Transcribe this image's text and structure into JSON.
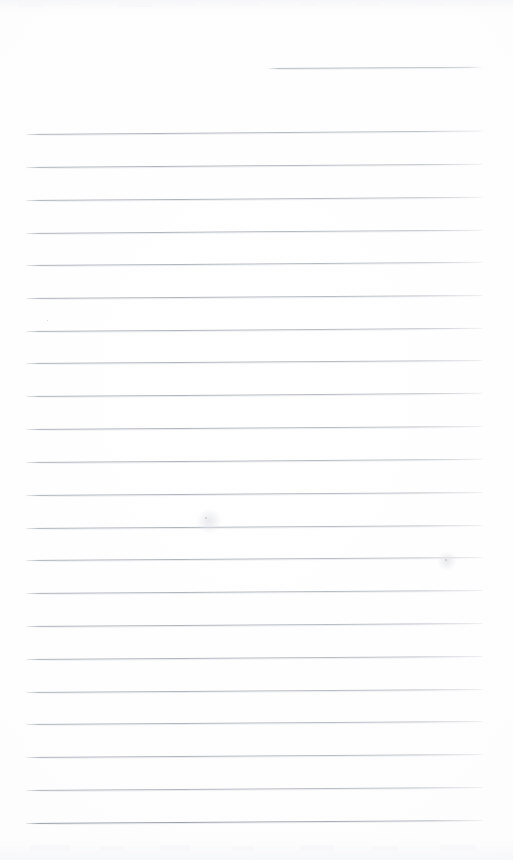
{
  "document": {
    "kind": "lined-notepad-page",
    "title": "Blank ruled notepad page",
    "background_color": "#fdfdfe",
    "rule_color": "#b2b7bf",
    "heavy_rule_color": "#9aa0aa",
    "width": 513,
    "height": 860,
    "text_content": "",
    "visible_text": []
  },
  "rules": {
    "short_rule": {
      "label": "short top-right rule",
      "x": 268,
      "y": 68,
      "width": 215
    },
    "full_rules": [
      {
        "y": 134,
        "x": 26,
        "width": 458,
        "tilt": -0.45
      },
      {
        "y": 167,
        "x": 26,
        "width": 458,
        "tilt": -0.42
      },
      {
        "y": 200,
        "x": 26,
        "width": 458,
        "tilt": -0.4
      },
      {
        "y": 233,
        "x": 26,
        "width": 458,
        "tilt": -0.42
      },
      {
        "y": 265,
        "x": 26,
        "width": 458,
        "tilt": -0.4
      },
      {
        "y": 298,
        "x": 26,
        "width": 458,
        "tilt": -0.38
      },
      {
        "y": 331,
        "x": 26,
        "width": 458,
        "tilt": -0.4
      },
      {
        "y": 363,
        "x": 26,
        "width": 458,
        "tilt": -0.38
      },
      {
        "y": 396,
        "x": 26,
        "width": 458,
        "tilt": -0.4
      },
      {
        "y": 429,
        "x": 26,
        "width": 458,
        "tilt": -0.38
      },
      {
        "y": 462,
        "x": 26,
        "width": 458,
        "tilt": -0.4
      },
      {
        "y": 495,
        "x": 26,
        "width": 458,
        "tilt": -0.38
      },
      {
        "y": 528,
        "x": 26,
        "width": 458,
        "tilt": -0.38
      },
      {
        "y": 560,
        "x": 26,
        "width": 458,
        "tilt": -0.36
      },
      {
        "y": 593,
        "x": 26,
        "width": 458,
        "tilt": -0.38
      },
      {
        "y": 626,
        "x": 26,
        "width": 458,
        "tilt": -0.36
      },
      {
        "y": 659,
        "x": 26,
        "width": 458,
        "tilt": -0.38
      },
      {
        "y": 692,
        "x": 26,
        "width": 458,
        "tilt": -0.36
      },
      {
        "y": 724,
        "x": 26,
        "width": 458,
        "tilt": -0.38
      },
      {
        "y": 757,
        "x": 26,
        "width": 458,
        "tilt": -0.36
      },
      {
        "y": 790,
        "x": 26,
        "width": 458,
        "tilt": -0.38
      },
      {
        "y": 823,
        "x": 26,
        "width": 458,
        "tilt": -0.36,
        "heavy": true
      }
    ]
  },
  "marks": {
    "specks": [
      {
        "x": 205,
        "y": 517,
        "size": 2
      },
      {
        "x": 445,
        "y": 559,
        "size": 2
      },
      {
        "x": 47,
        "y": 320,
        "size": 1
      }
    ],
    "smudges": [
      {
        "x": 196,
        "y": 508,
        "size": 26
      },
      {
        "x": 437,
        "y": 551,
        "size": 20
      }
    ],
    "flecks": [
      {
        "x": 18,
        "y": 2,
        "w": 26,
        "h": 5
      },
      {
        "x": 64,
        "y": 1,
        "w": 14,
        "h": 4
      },
      {
        "x": 118,
        "y": 2,
        "w": 34,
        "h": 5
      },
      {
        "x": 176,
        "y": 1,
        "w": 20,
        "h": 5
      },
      {
        "x": 232,
        "y": 2,
        "w": 28,
        "h": 4
      },
      {
        "x": 300,
        "y": 1,
        "w": 18,
        "h": 5
      },
      {
        "x": 356,
        "y": 2,
        "w": 22,
        "h": 4
      },
      {
        "x": 416,
        "y": 1,
        "w": 30,
        "h": 5
      },
      {
        "x": 472,
        "y": 2,
        "w": 16,
        "h": 4
      },
      {
        "x": 30,
        "y": 845,
        "w": 40,
        "h": 6
      },
      {
        "x": 100,
        "y": 846,
        "w": 24,
        "h": 5
      },
      {
        "x": 160,
        "y": 845,
        "w": 30,
        "h": 6
      },
      {
        "x": 232,
        "y": 846,
        "w": 22,
        "h": 5
      },
      {
        "x": 300,
        "y": 845,
        "w": 34,
        "h": 6
      },
      {
        "x": 372,
        "y": 846,
        "w": 26,
        "h": 5
      },
      {
        "x": 440,
        "y": 845,
        "w": 36,
        "h": 6
      }
    ]
  }
}
